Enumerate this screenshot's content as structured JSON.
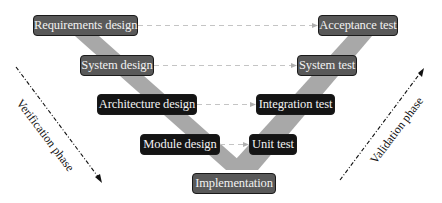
{
  "diagram": {
    "colors": {
      "gray_node": "#595959",
      "black_node": "#141414",
      "v_band": "#a8a8a8",
      "dashed_link": "#c4c4c4",
      "phase_arrow": "#111111"
    },
    "left_nodes": [
      {
        "id": "requirements",
        "label": "Requirements design",
        "style": "gray"
      },
      {
        "id": "system-design",
        "label": "System design",
        "style": "gray"
      },
      {
        "id": "architecture",
        "label": "Architecture design",
        "style": "black"
      },
      {
        "id": "module",
        "label": "Module design",
        "style": "black"
      }
    ],
    "bottom_node": {
      "id": "implementation",
      "label": "Implementation",
      "style": "gray"
    },
    "right_nodes": [
      {
        "id": "acceptance",
        "label": "Acceptance test",
        "style": "gray"
      },
      {
        "id": "system-test",
        "label": "System test",
        "style": "gray"
      },
      {
        "id": "integration",
        "label": "Integration test",
        "style": "black"
      },
      {
        "id": "unit",
        "label": "Unit test",
        "style": "black"
      }
    ],
    "links": [
      {
        "from": "Requirements design",
        "to": "Acceptance test"
      },
      {
        "from": "System design",
        "to": "System test"
      },
      {
        "from": "Architecture design",
        "to": "Integration test"
      },
      {
        "from": "Module design",
        "to": "Unit test"
      }
    ],
    "phases": {
      "left": "Verification phase",
      "right": "Validation phase"
    }
  }
}
